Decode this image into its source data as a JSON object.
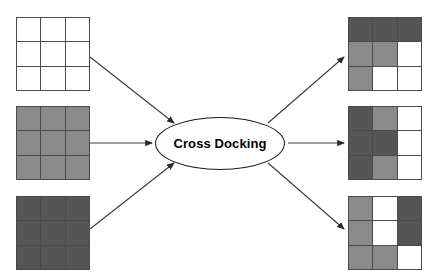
{
  "diagram": {
    "title": "Cross Docking",
    "type": "flow-diagram",
    "canvas": {
      "width": 432,
      "height": 280,
      "background": "#ffffff"
    },
    "hub": {
      "label": "Cross Docking",
      "shape": "ellipse",
      "x": 155,
      "y": 117,
      "width": 130,
      "height": 53,
      "fill": "#ffffff",
      "stroke": "#1a1a1a"
    },
    "palette": {
      "white": "#ffffff",
      "gray": "#8a8a8a",
      "dark": "#555555",
      "border": "#4a4a4a",
      "arrow": "#3a3a3a"
    },
    "inputs": [
      {
        "name": "inbound-pallet-1",
        "x": 16,
        "y": 17,
        "size": 74,
        "cells": [
          [
            "white",
            "white",
            "white"
          ],
          [
            "white",
            "white",
            "white"
          ],
          [
            "white",
            "white",
            "white"
          ]
        ]
      },
      {
        "name": "inbound-pallet-2",
        "x": 16,
        "y": 106,
        "size": 74,
        "cells": [
          [
            "gray",
            "gray",
            "gray"
          ],
          [
            "gray",
            "gray",
            "gray"
          ],
          [
            "gray",
            "gray",
            "gray"
          ]
        ]
      },
      {
        "name": "inbound-pallet-3",
        "x": 16,
        "y": 196,
        "size": 74,
        "cells": [
          [
            "dark",
            "dark",
            "dark"
          ],
          [
            "dark",
            "dark",
            "dark"
          ],
          [
            "dark",
            "dark",
            "dark"
          ]
        ]
      }
    ],
    "outputs": [
      {
        "name": "outbound-pallet-1",
        "x": 348,
        "y": 17,
        "size": 74,
        "cells": [
          [
            "dark",
            "dark",
            "dark"
          ],
          [
            "gray",
            "gray",
            "white"
          ],
          [
            "gray",
            "white",
            "white"
          ]
        ]
      },
      {
        "name": "outbound-pallet-2",
        "x": 348,
        "y": 106,
        "size": 74,
        "cells": [
          [
            "dark",
            "gray",
            "white"
          ],
          [
            "dark",
            "dark",
            "white"
          ],
          [
            "dark",
            "gray",
            "white"
          ]
        ]
      },
      {
        "name": "outbound-pallet-3",
        "x": 348,
        "y": 196,
        "size": 74,
        "cells": [
          [
            "gray",
            "white",
            "dark"
          ],
          [
            "gray",
            "white",
            "dark"
          ],
          [
            "gray",
            "gray",
            "white"
          ]
        ]
      }
    ],
    "arrows": [
      {
        "name": "arrow-in-1",
        "x1": 90,
        "y1": 57,
        "x2": 174,
        "y2": 123
      },
      {
        "name": "arrow-in-2",
        "x1": 90,
        "y1": 143,
        "x2": 152,
        "y2": 143
      },
      {
        "name": "arrow-in-3",
        "x1": 90,
        "y1": 229,
        "x2": 174,
        "y2": 163
      },
      {
        "name": "arrow-out-1",
        "x1": 268,
        "y1": 123,
        "x2": 344,
        "y2": 57
      },
      {
        "name": "arrow-out-2",
        "x1": 288,
        "y1": 143,
        "x2": 344,
        "y2": 143
      },
      {
        "name": "arrow-out-3",
        "x1": 268,
        "y1": 163,
        "x2": 344,
        "y2": 229
      }
    ]
  }
}
